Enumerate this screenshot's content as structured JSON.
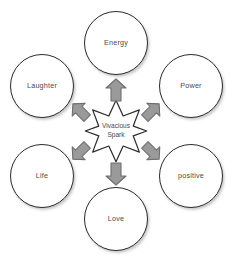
{
  "diagram": {
    "type": "radial-hub-and-spoke",
    "background_color": "#ffffff",
    "center": {
      "shape": "eight-pointed-star",
      "label_line1": "Vivacious",
      "label_line2": "Spark",
      "fill_color": "#ffffff",
      "stroke_color": "#2b2b2b"
    },
    "arrow_style": {
      "fill_color": "#9a9a9a",
      "stroke_color": "#6e6e6e",
      "direction": "outward-from-center",
      "count": 6
    },
    "node_style": {
      "fill_color": "#ffffff",
      "stroke_color": "#2b2b2b",
      "text_color": "#4a4a4a"
    },
    "nodes": [
      {
        "id": "energy",
        "label": "Energy",
        "position": "top",
        "arrow_direction": "up"
      },
      {
        "id": "power",
        "label": "Power",
        "position": "upper-right",
        "arrow_direction": "up-right"
      },
      {
        "id": "positive",
        "label": "positive",
        "position": "lower-right",
        "arrow_direction": "down-right"
      },
      {
        "id": "love",
        "label": "Love",
        "position": "bottom",
        "arrow_direction": "down"
      },
      {
        "id": "life",
        "label": "Life",
        "position": "lower-left",
        "arrow_direction": "down-left"
      },
      {
        "id": "laughter",
        "label": "Laughter",
        "position": "upper-left",
        "arrow_direction": "up-left"
      }
    ]
  }
}
